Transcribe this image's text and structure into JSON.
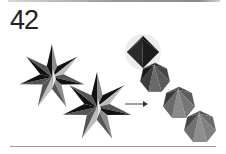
{
  "figure": {
    "number": "42",
    "arrow_direction": "right"
  },
  "colors": {
    "rule": "#9a9a9a",
    "label": "#222222",
    "dark": "#111111",
    "mid": "#555555",
    "light": "#8c8c8c",
    "pale": "#bdbdbd"
  },
  "shapes": {
    "stars": [
      {
        "id": "star-1",
        "points": 7,
        "cx": 52,
        "cy": 77,
        "r_outer": 33,
        "r_inner": 12
      },
      {
        "id": "star-2",
        "points": 7,
        "cx": 97,
        "cy": 107,
        "r_outer": 35,
        "r_inner": 13
      }
    ],
    "polyhedra": [
      {
        "id": "polyhedron-1",
        "cx": 143,
        "cy": 52,
        "r": 16
      },
      {
        "id": "polyhedron-2",
        "cx": 155,
        "cy": 78,
        "r": 15
      },
      {
        "id": "polyhedron-3",
        "cx": 179,
        "cy": 103,
        "r": 16
      },
      {
        "id": "polyhedron-4",
        "cx": 200,
        "cy": 127,
        "r": 16
      }
    ],
    "arrow": {
      "x1": 125,
      "y1": 104,
      "x2": 148,
      "y2": 104
    }
  }
}
